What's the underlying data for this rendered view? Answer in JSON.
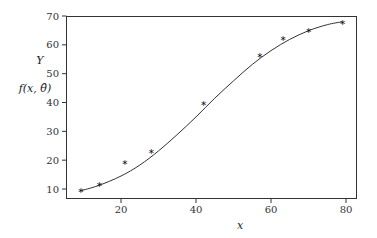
{
  "chart_data": {
    "type": "scatter",
    "title": "",
    "xlabel": "x",
    "ylabel_lines": [
      "Y",
      "f(x, θ̂)"
    ],
    "xlim": [
      0,
      82.5
    ],
    "ylim": [
      7.0,
      70
    ],
    "grid": false,
    "legend": null,
    "x_ticks": [
      20,
      40,
      60,
      80
    ],
    "y_ticks": [
      10,
      20,
      30,
      40,
      50,
      60,
      70
    ],
    "series": [
      {
        "name": "Y (observed)",
        "kind": "scatter",
        "marker": "star",
        "x": [
          9.3,
          14.2,
          21.0,
          28.1,
          42.0,
          57.0,
          63.2,
          70.0,
          79.1
        ],
        "y": [
          9.6,
          11.6,
          19.5,
          23.2,
          39.9,
          56.5,
          62.5,
          65.2,
          68.0
        ]
      },
      {
        "name": "f(x, θ̂) (fitted curve)",
        "kind": "line",
        "x": [
          9,
          14,
          20,
          25,
          30,
          35,
          40,
          45,
          50,
          55,
          60,
          65,
          70,
          75,
          79
        ],
        "y": [
          9.3,
          11.2,
          14.5,
          18.3,
          23.2,
          28.9,
          35.0,
          41.5,
          47.5,
          53.2,
          58.0,
          61.9,
          64.9,
          67.0,
          68.0
        ]
      }
    ]
  },
  "labels": {
    "x_axis": "x",
    "y_axis_top": "Y",
    "y_axis_bottom_prefix": "f(x, ",
    "y_axis_bottom_theta": "θ̂",
    "y_axis_bottom_suffix": ")"
  },
  "colors": {
    "axis": "#333333",
    "curve": "#333333",
    "marker": "#111111"
  }
}
